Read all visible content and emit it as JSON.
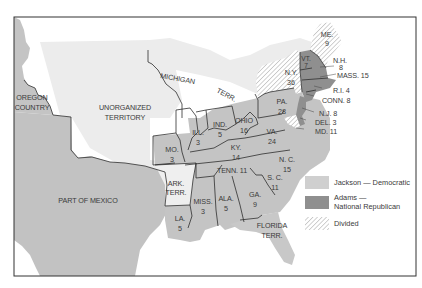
{
  "map": {
    "title": "",
    "colors": {
      "jackson": "#c4c4c4",
      "adams": "#8f8f8f",
      "divided_stripe": "#c8c8c8",
      "territory_light": "#ececec",
      "mexico": "#c2c2c2",
      "water": "#ffffff",
      "frame": "#333333"
    },
    "regions": {
      "oregon": "OREGON",
      "oregon2": "COUNTRY",
      "unorganized": "UNORGANIZED",
      "unorganized2": "TERRITORY",
      "michigan": "MICHIGAN",
      "michigan_terr": "TERR.",
      "mexico": "PART OF MEXICO",
      "ark": "ARK.",
      "ark2": "TERR.",
      "florida": "FLORIDA",
      "florida2": "TERR."
    },
    "states": [
      {
        "abbr": "ME.",
        "votes": "9",
        "result": "divided"
      },
      {
        "abbr": "VT.",
        "votes": "7",
        "result": "adams"
      },
      {
        "abbr": "N.H.",
        "votes": "8",
        "result": "adams"
      },
      {
        "abbr": "MASS.",
        "votes": "15",
        "result": "adams"
      },
      {
        "abbr": "N.Y.",
        "votes": "36",
        "result": "divided"
      },
      {
        "abbr": "R.I.",
        "votes": "4",
        "result": "adams"
      },
      {
        "abbr": "CONN.",
        "votes": "8",
        "result": "adams"
      },
      {
        "abbr": "N.J.",
        "votes": "8",
        "result": "adams"
      },
      {
        "abbr": "DEL.",
        "votes": "3",
        "result": "adams"
      },
      {
        "abbr": "MD.",
        "votes": "11",
        "result": "divided"
      },
      {
        "abbr": "PA.",
        "votes": "28",
        "result": "jackson"
      },
      {
        "abbr": "OHIO",
        "votes": "16",
        "result": "jackson"
      },
      {
        "abbr": "IND.",
        "votes": "5",
        "result": "jackson"
      },
      {
        "abbr": "ILL.",
        "votes": "3",
        "result": "jackson"
      },
      {
        "abbr": "MO.",
        "votes": "3",
        "result": "jackson"
      },
      {
        "abbr": "KY.",
        "votes": "14",
        "result": "jackson"
      },
      {
        "abbr": "VA.",
        "votes": "24",
        "result": "jackson"
      },
      {
        "abbr": "N. C.",
        "votes": "15",
        "result": "jackson"
      },
      {
        "abbr": "TENN.",
        "votes": "11",
        "result": "jackson"
      },
      {
        "abbr": "S. C.",
        "votes": "11",
        "result": "jackson"
      },
      {
        "abbr": "GA.",
        "votes": "9",
        "result": "jackson"
      },
      {
        "abbr": "ALA.",
        "votes": "5",
        "result": "jackson"
      },
      {
        "abbr": "MISS.",
        "votes": "3",
        "result": "jackson"
      },
      {
        "abbr": "LA.",
        "votes": "5",
        "result": "jackson"
      }
    ],
    "labels": {
      "me": "ME.",
      "me_v": "9",
      "vt": "VT.",
      "vt_v": "7",
      "nh": "N.H.",
      "nh_v": "8",
      "mass": "MASS. 15",
      "ny": "N.Y.",
      "ny_v": "36",
      "ri": "R.I. 4",
      "conn": "CONN. 8",
      "nj": "N.J. 8",
      "del": "DEL. 3",
      "md": "MD. 11",
      "pa": "PA.",
      "pa_v": "28",
      "ohio": "OHIO",
      "ohio_v": "16",
      "ind": "IND.",
      "ind_v": "5",
      "ill": "ILL.",
      "ill_v": "3",
      "mo": "MO.",
      "mo_v": "3",
      "ky": "KY.",
      "ky_v": "14",
      "va": "VA.",
      "va_v": "24",
      "nc": "N. C.",
      "nc_v": "15",
      "tenn": "TENN. 11",
      "sc": "S. C.",
      "sc_v": "11",
      "ga": "GA.",
      "ga_v": "9",
      "ala": "ALA.",
      "ala_v": "5",
      "miss": "MISS.",
      "miss_v": "3",
      "la": "LA.",
      "la_v": "5"
    }
  },
  "legend": {
    "items": [
      {
        "key": "jackson",
        "label": "Jackson — Democratic",
        "label2": ""
      },
      {
        "key": "adams",
        "label": "Adams —",
        "label2": "National Republican"
      },
      {
        "key": "divided",
        "label": "Divided",
        "label2": ""
      }
    ]
  }
}
